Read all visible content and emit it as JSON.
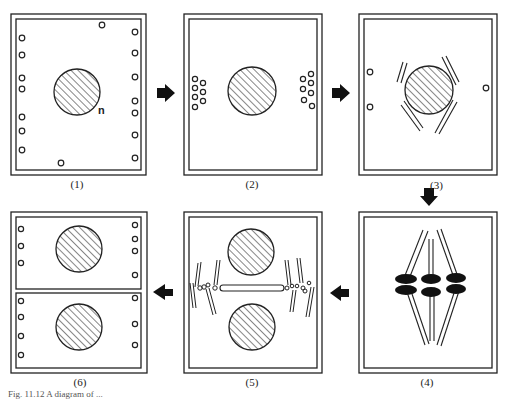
{
  "figure": {
    "panels": [
      {
        "id": 1,
        "label": "(1)",
        "nucleus_label": "n"
      },
      {
        "id": 2,
        "label": "(2)"
      },
      {
        "id": 3,
        "label": "(3)"
      },
      {
        "id": 4,
        "label": "(4)"
      },
      {
        "id": 5,
        "label": "(5)"
      },
      {
        "id": 6,
        "label": "(6)"
      }
    ],
    "arrows": [
      {
        "from": 1,
        "to": 2,
        "direction": "right"
      },
      {
        "from": 2,
        "to": 3,
        "direction": "right"
      },
      {
        "from": 3,
        "to": 4,
        "direction": "down"
      },
      {
        "from": 4,
        "to": 5,
        "direction": "left"
      },
      {
        "from": 5,
        "to": 6,
        "direction": "left"
      }
    ],
    "caption_fragment": "Fig. 11.12 A diagram of ..."
  }
}
